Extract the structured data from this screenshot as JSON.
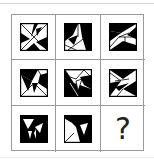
{
  "puzzle": {
    "rows": 3,
    "cols": 3,
    "cells": [
      {
        "row": 1,
        "col": 1,
        "type": "figure",
        "figure": "pinwheel-triangles-a"
      },
      {
        "row": 1,
        "col": 2,
        "type": "figure",
        "figure": "pinwheel-triangles-b"
      },
      {
        "row": 1,
        "col": 3,
        "type": "figure",
        "figure": "pinwheel-triangles-c"
      },
      {
        "row": 2,
        "col": 1,
        "type": "figure",
        "figure": "pinwheel-triangles-d"
      },
      {
        "row": 2,
        "col": 2,
        "type": "figure",
        "figure": "pinwheel-triangles-e"
      },
      {
        "row": 2,
        "col": 3,
        "type": "figure",
        "figure": "pinwheel-triangles-f"
      },
      {
        "row": 3,
        "col": 1,
        "type": "figure",
        "figure": "pinwheel-triangles-g"
      },
      {
        "row": 3,
        "col": 2,
        "type": "figure",
        "figure": "pinwheel-triangles-h"
      },
      {
        "row": 3,
        "col": 3,
        "type": "missing",
        "label": "?"
      }
    ],
    "missing_label": "?"
  },
  "colors": {
    "ink": "#000000",
    "paper": "#ffffff",
    "grid_line": "#9a9a9a"
  }
}
